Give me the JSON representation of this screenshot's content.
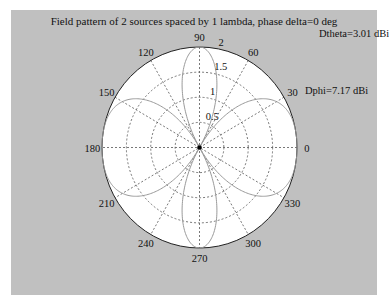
{
  "chart_data": {
    "type": "polar-line",
    "title": "Field pattern of 2 sources spaced by 1 lambda, phase delta=0 deg",
    "rmax": 2,
    "radial_ticks": [
      0.5,
      1,
      1.5,
      2
    ],
    "radial_tick_labels": [
      "0.5",
      "1",
      "1.5",
      "2"
    ],
    "radial_label_angle_deg": 80,
    "angle_ticks_deg": [
      0,
      30,
      60,
      90,
      120,
      150,
      180,
      210,
      240,
      270,
      300,
      330
    ],
    "angle_tick_labels": [
      "0",
      "30",
      "60",
      "90",
      "120",
      "150",
      "180",
      "210",
      "240",
      "270",
      "300",
      "330"
    ],
    "grid": true,
    "series": [
      {
        "name": "field pattern",
        "formula": "2*|cos(pi*cos(phi))|",
        "phi_deg": [
          0,
          15,
          30,
          45,
          60,
          75,
          90,
          105,
          120,
          135,
          150,
          165,
          180,
          195,
          210,
          225,
          240,
          255,
          270,
          285,
          300,
          315,
          330,
          345,
          360
        ],
        "r": [
          2.0,
          1.98,
          1.82,
          1.21,
          0.0,
          1.39,
          2.0,
          1.39,
          0.0,
          1.21,
          1.82,
          1.98,
          2.0,
          1.98,
          1.82,
          1.21,
          0.0,
          1.39,
          2.0,
          1.39,
          0.0,
          1.21,
          1.82,
          1.98,
          2.0
        ]
      }
    ],
    "annotations": [
      {
        "text": "Dtheta=3.01 dBi"
      },
      {
        "text": "Dphi=7.17 dBi"
      }
    ]
  },
  "figure": {
    "background": "#c0c0c0",
    "axes_background": "#ffffff",
    "pattern_color": "#9a9a9a",
    "grid_color": "#555555"
  }
}
